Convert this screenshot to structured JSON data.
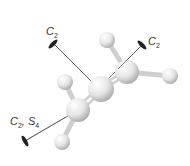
{
  "figure": {
    "molecule": "allene",
    "axes": [
      {
        "id": "c2-top",
        "symbol": "C",
        "subscript": "2",
        "label_text": "C2"
      },
      {
        "id": "c2-right",
        "symbol": "C",
        "subscript": "2",
        "label_text": "C2"
      },
      {
        "id": "c2-s4-bottom",
        "symbol": "C",
        "subscript": "2",
        "symbol2": "S",
        "subscript2": "4",
        "label_text": "C2, S4"
      }
    ],
    "colors": {
      "atom": "#e8e8e8",
      "bond": "#d6d6d6",
      "axis_line": "#444444",
      "axis_marker": "#222222"
    }
  }
}
